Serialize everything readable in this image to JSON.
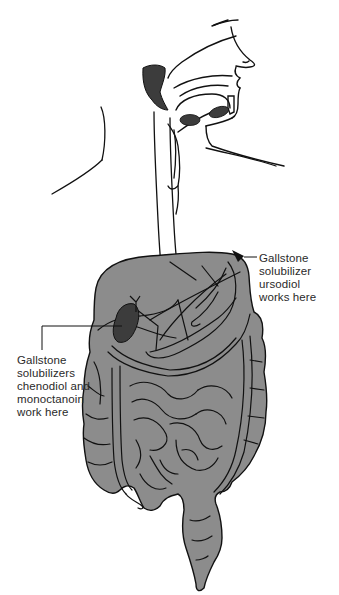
{
  "figure": {
    "colors": {
      "organ_fill": "#8c8c8c",
      "dark_fill": "#3c3c3c",
      "outline": "#111111",
      "background": "#ffffff",
      "text": "#2a2a2a"
    }
  },
  "callouts": [
    {
      "id": "ursodiol",
      "text": "Gallstone\nsolubilizer\nursodiol\nworks here",
      "points_to": "upper right of liver/stomach region"
    },
    {
      "id": "chenodiol",
      "text": "Gallstone\nsolubilizers\nchenodiol and\nmonoctanoin\nwork here",
      "points_to": "gallbladder"
    }
  ]
}
